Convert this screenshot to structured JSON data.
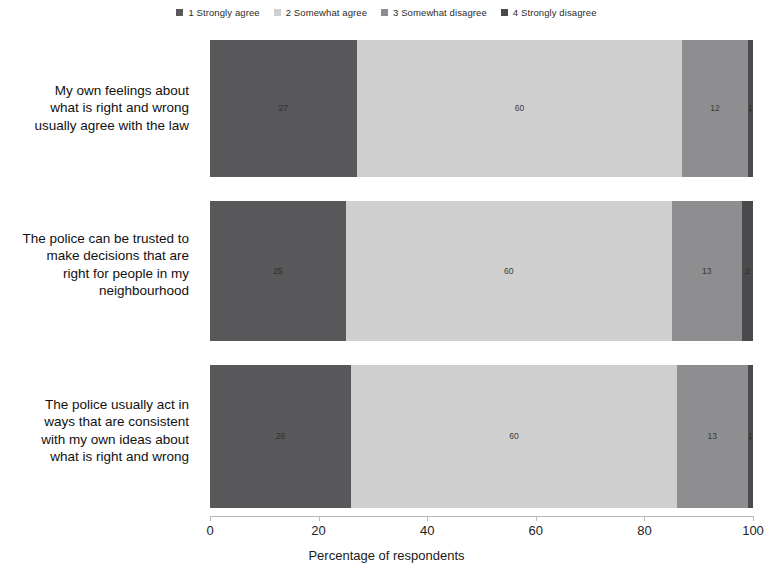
{
  "chart_data": {
    "type": "bar",
    "orientation": "horizontal",
    "stacked": true,
    "title": "",
    "subtitle": "",
    "xlabel": "Percentage of respondents",
    "ylabel": "",
    "xlim": [
      0,
      100
    ],
    "xticks": [
      0,
      20,
      40,
      60,
      80,
      100
    ],
    "xtick_labels": [
      "0",
      "20",
      "40",
      "60",
      "80",
      "100"
    ],
    "grid": false,
    "legend_position": "top-center",
    "categories": [
      "My own feelings about what is right and wrong usually agree with the law",
      "The police can be trusted to make decisions that are right for people in my neighbourhood",
      "The police usually act in ways that are consistent with my own ideas about what is right and wrong"
    ],
    "category_lines": [
      [
        "My own feelings about",
        "what is right and wrong",
        "usually agree with the law"
      ],
      [
        "The police can be trusted to",
        "make decisions that are",
        "right for people in my",
        "neighbourhood"
      ],
      [
        "The police usually act in",
        "ways that are consistent",
        "with my own ideas about",
        "what is right and wrong"
      ]
    ],
    "series": [
      {
        "name": "1 Strongly agree",
        "color": "#58585a",
        "values": [
          27,
          25,
          26
        ],
        "labels": [
          "27",
          "25",
          "26"
        ]
      },
      {
        "name": "2 Somewhat agree",
        "color": "#cfcfcf",
        "values": [
          60,
          60,
          60
        ],
        "labels": [
          "60",
          "60",
          "60"
        ]
      },
      {
        "name": "3 Somewhat disagree",
        "color": "#8e8e90",
        "values": [
          12,
          13,
          13
        ],
        "labels": [
          "12",
          "13",
          "13"
        ]
      },
      {
        "name": "4 Strongly disagree",
        "color": "#4a4a4c",
        "values": [
          1,
          2,
          1
        ],
        "labels": [
          "1",
          "2",
          "1"
        ]
      }
    ]
  }
}
